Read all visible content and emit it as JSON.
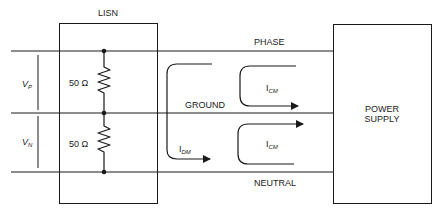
{
  "labels": {
    "lisn": "LISN",
    "phase": "PHASE",
    "ground": "GROUND",
    "neutral": "NEUTRAL",
    "power_supply_line1": "POWER",
    "power_supply_line2": "SUPPLY",
    "resistor_top": "50 Ω",
    "resistor_bottom": "50 Ω",
    "vp_main": "V",
    "vp_sub": "P",
    "vn_main": "V",
    "vn_sub": "N",
    "idm_main": "I",
    "idm_sub": "DM",
    "icm_top_main": "I",
    "icm_top_sub": "CM",
    "icm_bottom_main": "I",
    "icm_bottom_sub": "CM"
  },
  "colors": {
    "line": "#1a1a1a",
    "background": "#ffffff"
  }
}
